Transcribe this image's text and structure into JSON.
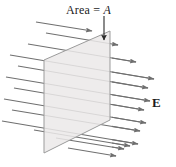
{
  "figure": {
    "background_color": "#ffffff",
    "width": 176,
    "height": 167
  },
  "labels": {
    "area": {
      "text_prefix": "Area = ",
      "text_symbol": "A",
      "full_text": "Area = A",
      "color": "#1b1b1b"
    },
    "field": {
      "text": "E",
      "color": "#1b1b1b"
    }
  },
  "pointer_arrow": {
    "name": "area-pointer-arrow",
    "from_x": 104,
    "from_y": 16,
    "to_x": 104,
    "to_y": 40,
    "color": "#2b2b2b"
  },
  "plane": {
    "name": "surface-parallelogram",
    "fill_color": "#ebe9e9",
    "stroke_color": "#9b9b9b",
    "points": "44,60 110,31 110,120 44,153"
  },
  "field_lines": {
    "name": "electric-field-lines",
    "color": "#6f6f6f",
    "count": 13,
    "slope_dy_per_dx": 0.16,
    "lines": [
      {
        "x1": 46,
        "y1": 33,
        "x2": 118,
        "y2": 45
      },
      {
        "x1": 28,
        "y1": 44,
        "x2": 136,
        "y2": 62
      },
      {
        "x1": 10,
        "y1": 55,
        "x2": 154,
        "y2": 79
      },
      {
        "x1": 18,
        "y1": 66,
        "x2": 148,
        "y2": 88
      },
      {
        "x1": 6,
        "y1": 77,
        "x2": 150,
        "y2": 101
      },
      {
        "x1": 14,
        "y1": 88,
        "x2": 144,
        "y2": 110
      },
      {
        "x1": 4,
        "y1": 99,
        "x2": 146,
        "y2": 123
      },
      {
        "x1": 12,
        "y1": 110,
        "x2": 140,
        "y2": 131
      },
      {
        "x1": 2,
        "y1": 121,
        "x2": 138,
        "y2": 144
      },
      {
        "x1": 34,
        "y1": 130,
        "x2": 130,
        "y2": 146
      },
      {
        "x1": 56,
        "y1": 138,
        "x2": 124,
        "y2": 149
      },
      {
        "x1": 68,
        "y1": 148,
        "x2": 116,
        "y2": 156
      },
      {
        "x1": 36,
        "y1": 22,
        "x2": 92,
        "y2": 31
      }
    ]
  }
}
